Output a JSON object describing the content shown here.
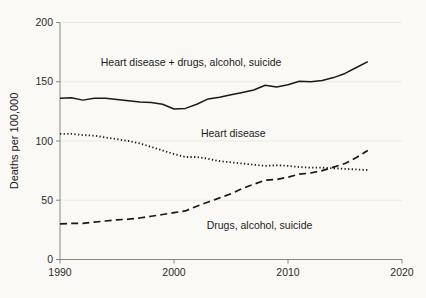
{
  "chart_data": {
    "type": "line",
    "title": "",
    "subtitle": "",
    "xlabel": "",
    "ylabel": "Deaths per 100,000",
    "xlim": [
      1990,
      2020
    ],
    "ylim": [
      0,
      200
    ],
    "xticks": [
      1990,
      2000,
      2010,
      2020
    ],
    "xtick_labels": [
      "1990",
      "2000",
      "2010",
      "2020"
    ],
    "yticks": [
      0,
      50,
      100,
      150,
      200
    ],
    "ytick_labels": [
      "0",
      "50",
      "100",
      "150",
      "200"
    ],
    "grid": "horizontal-faint",
    "legend_position": "inline-annotations",
    "x": [
      1990,
      1991,
      1992,
      1993,
      1994,
      1995,
      1996,
      1997,
      1998,
      1999,
      2000,
      2001,
      2002,
      2003,
      2004,
      2005,
      2006,
      2007,
      2008,
      2009,
      2010,
      2011,
      2012,
      2013,
      2014,
      2015,
      2016,
      2017
    ],
    "series": [
      {
        "name": "Heart disease + drugs, alcohol, suicide",
        "style": "solid",
        "color": "#1a1a1a",
        "label_x": 2001.5,
        "label_y": 163,
        "values": [
          136,
          136.5,
          134.5,
          136,
          136,
          135,
          134,
          133,
          132.5,
          131,
          127,
          127.5,
          131,
          135.5,
          137,
          139,
          141,
          143,
          147,
          145.5,
          147.5,
          150.5,
          150,
          151,
          153.5,
          157,
          162,
          167
        ]
      },
      {
        "name": "Heart disease",
        "style": "dotted",
        "color": "#1a1a1a",
        "label_x": 2005.2,
        "label_y": 103,
        "values": [
          106,
          106,
          105,
          104.5,
          103,
          101.5,
          100,
          98,
          95,
          92,
          89,
          86.5,
          86.5,
          85,
          83,
          82,
          81,
          80,
          79,
          79.5,
          79,
          78,
          77.5,
          77.5,
          77,
          76.5,
          76,
          75.5
        ]
      },
      {
        "name": "Drugs, alcohol, suicide",
        "style": "dashed",
        "color": "#1a1a1a",
        "label_x": 2007.5,
        "label_y": 26,
        "values": [
          30,
          30.5,
          30.5,
          31.5,
          32.5,
          33.5,
          34,
          35,
          36.5,
          38,
          39.5,
          41,
          45,
          48.5,
          52,
          55.5,
          60,
          63.5,
          67,
          67.5,
          69.5,
          72,
          73,
          75,
          78,
          81,
          86,
          92
        ]
      }
    ]
  },
  "axis": {
    "ylabel": "Deaths per 100,000"
  }
}
